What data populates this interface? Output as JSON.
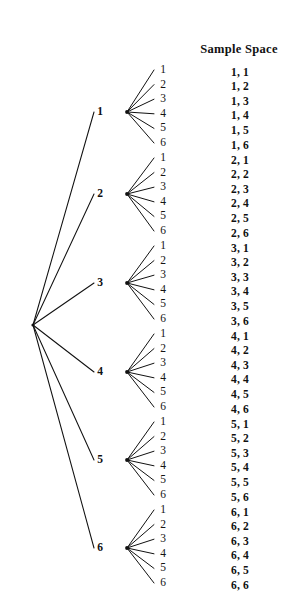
{
  "figure": {
    "title_visible": false,
    "background_color": "#ffffff",
    "ink_color": "#111111"
  },
  "heading": {
    "sample_space": "Sample Space"
  },
  "diagram": {
    "type": "probability-tree",
    "root": {
      "x": 33,
      "y": 325
    },
    "first_level_labels": [
      "1",
      "2",
      "3",
      "4",
      "5",
      "6"
    ],
    "second_level_labels": [
      "1",
      "2",
      "3",
      "4",
      "5",
      "6"
    ],
    "branch_nodes": [
      {
        "label": "1",
        "x": 127,
        "y": 112,
        "label_x": 100,
        "label_y": 112
      },
      {
        "label": "2",
        "x": 127,
        "y": 194,
        "label_x": 100,
        "label_y": 194
      },
      {
        "label": "3",
        "x": 127,
        "y": 283,
        "label_x": 100,
        "label_y": 283
      },
      {
        "label": "4",
        "x": 127,
        "y": 372,
        "label_x": 100,
        "label_y": 372
      },
      {
        "label": "5",
        "x": 127,
        "y": 460,
        "label_x": 100,
        "label_y": 460
      },
      {
        "label": "6",
        "x": 127,
        "y": 548,
        "label_x": 100,
        "label_y": 548
      }
    ],
    "leaf_x": 163,
    "leaf_line_end_x": 154,
    "leaf_spacing": 14.6,
    "groups": [
      {
        "first": "1",
        "leaf_start_y": 70
      },
      {
        "first": "2",
        "leaf_start_y": 158
      },
      {
        "first": "3",
        "leaf_start_y": 246
      },
      {
        "first": "4",
        "leaf_start_y": 334
      },
      {
        "first": "5",
        "leaf_start_y": 422
      },
      {
        "first": "6",
        "leaf_start_y": 510
      }
    ]
  },
  "sample_space": {
    "heading_x": 239,
    "heading_y": 49,
    "column_x": 231,
    "outcomes": [
      {
        "text": "1, 1",
        "y": 73
      },
      {
        "text": "1, 2",
        "y": 87
      },
      {
        "text": "1, 3",
        "y": 102
      },
      {
        "text": "1, 4",
        "y": 116
      },
      {
        "text": "1, 5",
        "y": 131
      },
      {
        "text": "1, 6",
        "y": 146
      },
      {
        "text": "2, 1",
        "y": 161
      },
      {
        "text": "2, 2",
        "y": 175
      },
      {
        "text": "2, 3",
        "y": 190
      },
      {
        "text": "2, 4",
        "y": 204
      },
      {
        "text": "2, 5",
        "y": 219
      },
      {
        "text": "2, 6",
        "y": 234
      },
      {
        "text": "3, 1",
        "y": 249
      },
      {
        "text": "3, 2",
        "y": 263
      },
      {
        "text": "3, 3",
        "y": 278
      },
      {
        "text": "3, 4",
        "y": 292
      },
      {
        "text": "3, 5",
        "y": 307
      },
      {
        "text": "3, 6",
        "y": 322
      },
      {
        "text": "4, 1",
        "y": 337
      },
      {
        "text": "4, 2",
        "y": 351
      },
      {
        "text": "4, 3",
        "y": 366
      },
      {
        "text": "4, 4",
        "y": 380
      },
      {
        "text": "4, 5",
        "y": 395
      },
      {
        "text": "4, 6",
        "y": 410
      },
      {
        "text": "5, 1",
        "y": 425
      },
      {
        "text": "5, 2",
        "y": 439
      },
      {
        "text": "5, 3",
        "y": 454
      },
      {
        "text": "5, 4",
        "y": 468
      },
      {
        "text": "5, 5",
        "y": 483
      },
      {
        "text": "5, 6",
        "y": 498
      },
      {
        "text": "6, 1",
        "y": 513
      },
      {
        "text": "6, 2",
        "y": 527
      },
      {
        "text": "6, 3",
        "y": 542
      },
      {
        "text": "6, 4",
        "y": 556
      },
      {
        "text": "6, 5",
        "y": 571
      },
      {
        "text": "6, 6",
        "y": 586
      }
    ]
  },
  "chart_data": {
    "type": "tree",
    "title": "Sample Space",
    "stage_1_outcomes": [
      1,
      2,
      3,
      4,
      5,
      6
    ],
    "stage_2_outcomes": [
      1,
      2,
      3,
      4,
      5,
      6
    ],
    "total_outcomes": 36,
    "sample_space": [
      "1, 1",
      "1, 2",
      "1, 3",
      "1, 4",
      "1, 5",
      "1, 6",
      "2, 1",
      "2, 2",
      "2, 3",
      "2, 4",
      "2, 5",
      "2, 6",
      "3, 1",
      "3, 2",
      "3, 3",
      "3, 4",
      "3, 5",
      "3, 6",
      "4, 1",
      "4, 2",
      "4, 3",
      "4, 4",
      "4, 5",
      "4, 6",
      "5, 1",
      "5, 2",
      "5, 3",
      "5, 4",
      "5, 5",
      "5, 6",
      "6, 1",
      "6, 2",
      "6, 3",
      "6, 4",
      "6, 5",
      "6, 6"
    ]
  }
}
